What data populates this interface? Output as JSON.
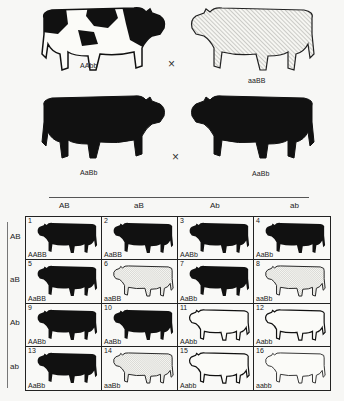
{
  "parents": {
    "p_generation": {
      "left": {
        "genotype": "AAbb",
        "phenotype": "black-and-white spotted"
      },
      "right": {
        "genotype": "aaBB",
        "phenotype": "light (hatched)"
      },
      "cross_symbol": "×"
    },
    "f1_generation": {
      "left": {
        "genotype": "AaBb",
        "phenotype": "solid black"
      },
      "right": {
        "genotype": "AaBb",
        "phenotype": "solid black"
      },
      "cross_symbol": "×"
    }
  },
  "gametes": {
    "columns": [
      "AB",
      "aB",
      "Ab",
      "ab"
    ],
    "rows": [
      "AB",
      "aB",
      "Ab",
      "ab"
    ]
  },
  "punnett": [
    {
      "n": "1",
      "genotype": "AABB",
      "phenotype": "black"
    },
    {
      "n": "2",
      "genotype": "AaBB",
      "phenotype": "black"
    },
    {
      "n": "3",
      "genotype": "AABb",
      "phenotype": "black"
    },
    {
      "n": "4",
      "genotype": "AaBb",
      "phenotype": "black"
    },
    {
      "n": "5",
      "genotype": "AaBB",
      "phenotype": "black"
    },
    {
      "n": "6",
      "genotype": "aaBB",
      "phenotype": "light"
    },
    {
      "n": "7",
      "genotype": "AaBb",
      "phenotype": "black"
    },
    {
      "n": "8",
      "genotype": "aaBb",
      "phenotype": "light"
    },
    {
      "n": "9",
      "genotype": "AABb",
      "phenotype": "black"
    },
    {
      "n": "10",
      "genotype": "AaBb",
      "phenotype": "black"
    },
    {
      "n": "11",
      "genotype": "AAbb",
      "phenotype": "spotted"
    },
    {
      "n": "12",
      "genotype": "Aabb",
      "phenotype": "spotted"
    },
    {
      "n": "13",
      "genotype": "AaBb",
      "phenotype": "black"
    },
    {
      "n": "14",
      "genotype": "aaBb",
      "phenotype": "light"
    },
    {
      "n": "15",
      "genotype": "Aabb",
      "phenotype": "spotted"
    },
    {
      "n": "16",
      "genotype": "aabb",
      "phenotype": "light-spotted"
    }
  ],
  "colors": {
    "black": "#111111",
    "light": "#f4f4f0",
    "hatch": "#8a8a86",
    "line": "#222222"
  }
}
